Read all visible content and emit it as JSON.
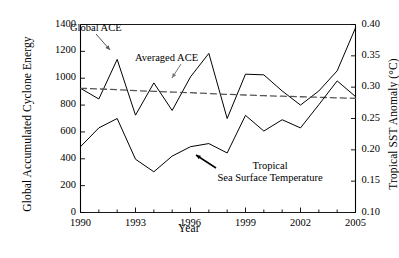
{
  "chart_data": {
    "type": "line",
    "title": "",
    "xlabel": "Year",
    "ylabel": "Global Accumulated Cyclone Energy",
    "y2label": "Tropical SST Anomaly (°C)",
    "xlim": [
      1990,
      2005
    ],
    "ylim": [
      0,
      1400
    ],
    "y2lim": [
      0.1,
      0.4
    ],
    "grid": false,
    "legend_position": "none",
    "xticks": [
      1990,
      1993,
      1996,
      1999,
      2002,
      2005
    ],
    "xtick_labels": [
      "1990",
      "1993",
      "1996",
      "1999",
      "2002",
      "2005"
    ],
    "xminorticks": [
      1991,
      1992,
      1994,
      1995,
      1997,
      1998,
      2000,
      2001,
      2003,
      2004
    ],
    "yticks": [
      0,
      200,
      400,
      600,
      800,
      1000,
      1200,
      1400
    ],
    "ytick_labels": [
      "0",
      "200",
      "400",
      "600",
      "800",
      "1000",
      "1200",
      "1400"
    ],
    "y2ticks": [
      0.1,
      0.15,
      0.2,
      0.25,
      0.3,
      0.35,
      0.4
    ],
    "y2tick_labels": [
      "0.10",
      "0.15",
      "0.20",
      "0.25",
      "0.30",
      "0.35",
      "0.40"
    ],
    "x": [
      1990,
      1991,
      1992,
      1993,
      1994,
      1995,
      1996,
      1997,
      1998,
      1999,
      2000,
      2001,
      2002,
      2003,
      2004,
      2005
    ],
    "series": [
      {
        "name": "Global ACE",
        "axis": "left",
        "style": "solid",
        "color": "#000000",
        "values": [
          925,
          845,
          1140,
          725,
          965,
          760,
          1010,
          1185,
          700,
          1030,
          1025,
          905,
          800,
          905,
          1055,
          1375
        ]
      },
      {
        "name": "Averaged ACE",
        "axis": "left",
        "style": "dashed",
        "color": "#555555",
        "values": [
          925,
          920,
          915,
          908,
          902,
          897,
          892,
          886,
          880,
          875,
          870,
          866,
          862,
          858,
          854,
          850
        ]
      },
      {
        "name": "Tropical Sea Surface Temperature",
        "axis": "right",
        "style": "solid",
        "color": "#000000",
        "values": [
          0.205,
          0.235,
          0.25,
          0.185,
          0.165,
          0.19,
          0.205,
          0.21,
          0.195,
          0.255,
          0.23,
          0.248,
          0.235,
          0.272,
          0.31,
          0.285
        ]
      }
    ],
    "annotations": [
      {
        "text": "Global ACE",
        "target_series": "Global ACE",
        "target_year": 1992
      },
      {
        "text": "Averaged ACE",
        "target_series": "Averaged ACE",
        "target_year": 1995
      },
      {
        "text_line1": "Tropical",
        "text_line2": "Sea Surface Temperature",
        "target_series": "Tropical Sea Surface Temperature",
        "target_year": 1997
      }
    ]
  },
  "labels": {
    "ylabel_left": "Global Accumulated Cyclone Energy",
    "ylabel_right": "Tropical SST Anomaly (°C)",
    "xlabel": "Year",
    "annot_global_ace": "Global ACE",
    "annot_averaged_ace": "Averaged ACE",
    "annot_sst_line1": "Tropical",
    "annot_sst_line2": "Sea Surface Temperature"
  },
  "colors": {
    "axis": "#000000",
    "ace_line": "#000000",
    "averaged_line": "#555555",
    "sst_line": "#000000",
    "background": "#ffffff"
  }
}
